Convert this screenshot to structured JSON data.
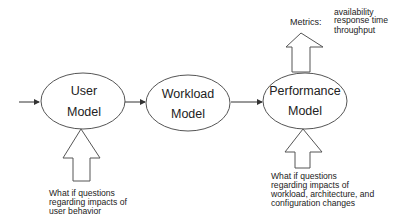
{
  "nodes": [
    {
      "id": "user",
      "line1": "User",
      "line2": "Model"
    },
    {
      "id": "workload",
      "line1": "Workload",
      "line2": "Model"
    },
    {
      "id": "performance",
      "line1": "Performance",
      "line2": "Model"
    }
  ],
  "metrics": {
    "label": "Metrics:",
    "items": [
      "availability",
      "response time",
      "throughput"
    ]
  },
  "user_questions": {
    "lines": [
      "What  if questions",
      "regarding impacts of",
      "user behavior"
    ]
  },
  "performance_questions": {
    "lines": [
      "What  if questions",
      "regarding impacts of",
      "workload, architecture, and",
      "configuration changes"
    ]
  },
  "colors": {
    "stroke": "#555555",
    "text": "#222222",
    "background": "#ffffff"
  }
}
